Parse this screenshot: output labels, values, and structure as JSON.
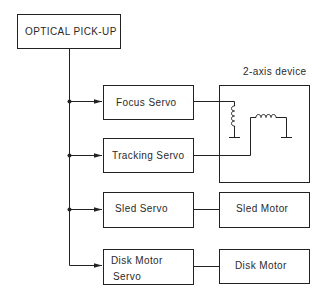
{
  "diagram": {
    "source_block": {
      "label": "OPTICAL PICK-UP"
    },
    "servo_blocks": [
      {
        "id": "focus",
        "label_lines": [
          "Focus Servo"
        ]
      },
      {
        "id": "tracking",
        "label_lines": [
          "Tracking Servo"
        ]
      },
      {
        "id": "sled",
        "label_lines": [
          "Sled Servo"
        ]
      },
      {
        "id": "disk",
        "label_lines": [
          "Disk Motor",
          "Servo"
        ]
      }
    ],
    "device_blocks": [
      {
        "id": "two-axis",
        "label": "2-axis device",
        "label_position": "above"
      },
      {
        "id": "sled-motor",
        "label": "Sled Motor"
      },
      {
        "id": "disk-motor",
        "label": "Disk Motor"
      }
    ],
    "connections": [
      {
        "from": "OPTICAL PICK-UP",
        "to": "Focus Servo",
        "type": "arrow"
      },
      {
        "from": "OPTICAL PICK-UP",
        "to": "Tracking Servo",
        "type": "arrow"
      },
      {
        "from": "OPTICAL PICK-UP",
        "to": "Sled Servo",
        "type": "arrow"
      },
      {
        "from": "OPTICAL PICK-UP",
        "to": "Disk Motor Servo",
        "type": "arrow"
      },
      {
        "from": "Focus Servo",
        "to": "2-axis device (focus coil)",
        "type": "line"
      },
      {
        "from": "Tracking Servo",
        "to": "2-axis device (tracking coil)",
        "type": "line"
      },
      {
        "from": "Sled Servo",
        "to": "Sled Motor",
        "type": "line"
      },
      {
        "from": "Disk Motor Servo",
        "to": "Disk Motor",
        "type": "line"
      }
    ]
  }
}
